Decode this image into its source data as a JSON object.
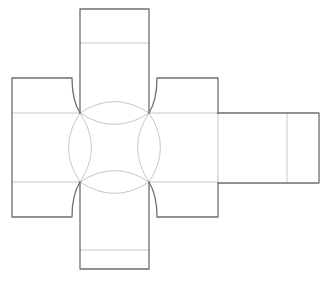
{
  "diagram": {
    "type": "box-net",
    "colors": {
      "cut_line": "#6e6e6e",
      "fold_line": "#c4c4c4",
      "background": "#ffffff"
    },
    "center_square": {
      "x": 80,
      "y": 113,
      "w": 69,
      "h": 69
    },
    "panels": [
      {
        "name": "top-flap",
        "x": 80,
        "y": 9,
        "w": 69,
        "h": 104,
        "fold_y": 43
      },
      {
        "name": "bottom-flap",
        "x": 80,
        "y": 182,
        "w": 69,
        "h": 87,
        "fold_y": 250
      },
      {
        "name": "left-flap",
        "x": 12,
        "y": 78,
        "w": 60,
        "h": 140
      },
      {
        "name": "right-flap",
        "x": 157,
        "y": 78,
        "w": 61,
        "h": 140
      },
      {
        "name": "right-strip",
        "x": 218,
        "y": 113,
        "w": 101,
        "h": 70,
        "fold_x": 287
      }
    ]
  }
}
